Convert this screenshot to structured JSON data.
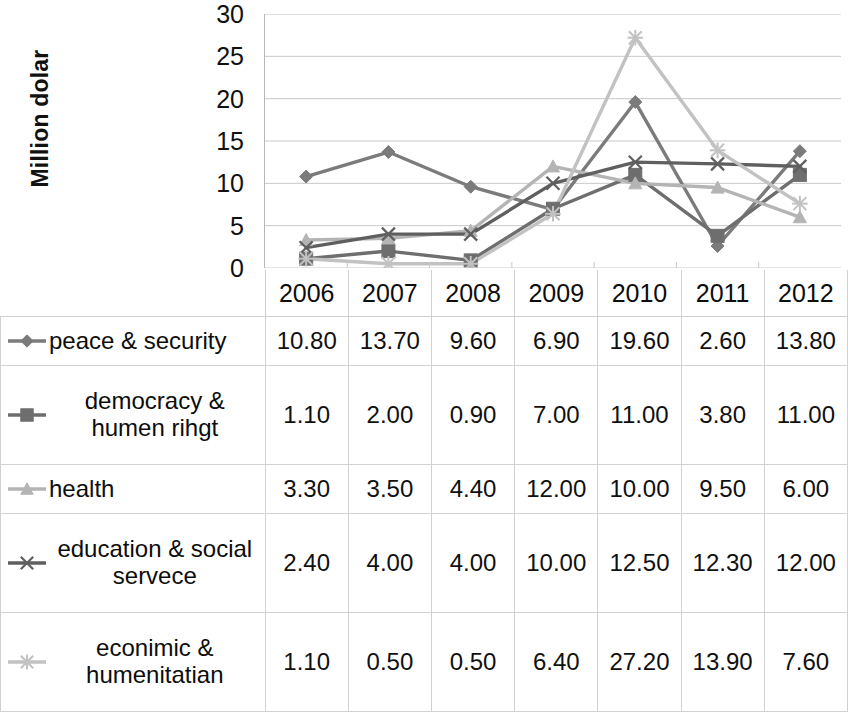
{
  "axis": {
    "y_title": "Million dolar",
    "y_ticks": [
      "30",
      "25",
      "20",
      "15",
      "10",
      "5",
      "0"
    ]
  },
  "table": {
    "year_header_blank": "",
    "years": [
      "2006",
      "2007",
      "2008",
      "2009",
      "2010",
      "2011",
      "2012"
    ],
    "rows": [
      {
        "label": "peace & security",
        "marker": "diamond-marker-icon",
        "color": "#7b7b7b",
        "values": [
          "10.80",
          "13.70",
          "9.60",
          "6.90",
          "19.60",
          "2.60",
          "13.80"
        ]
      },
      {
        "label": "democracy & humen rihgt",
        "marker": "square-marker-icon",
        "color": "#6e6e6e",
        "values": [
          "1.10",
          "2.00",
          "0.90",
          "7.00",
          "11.00",
          "3.80",
          "11.00"
        ]
      },
      {
        "label": "health",
        "marker": "triangle-marker-icon",
        "color": "#b4b4b4",
        "values": [
          "3.30",
          "3.50",
          "4.40",
          "12.00",
          "10.00",
          "9.50",
          "6.00"
        ]
      },
      {
        "label": "education & social servece",
        "marker": "cross-marker-icon",
        "color": "#5f5f5f",
        "values": [
          "2.40",
          "4.00",
          "4.00",
          "10.00",
          "12.50",
          "12.30",
          "12.00"
        ]
      },
      {
        "label": "econimic & humenitatian",
        "marker": "star-marker-icon",
        "color": "#c2c2c2",
        "values": [
          "1.10",
          "0.50",
          "0.50",
          "6.40",
          "27.20",
          "13.90",
          "7.60"
        ]
      }
    ]
  },
  "chart_data": {
    "type": "line",
    "title": "",
    "xlabel": "",
    "ylabel": "Million dolar",
    "categories": [
      "2006",
      "2007",
      "2008",
      "2009",
      "2010",
      "2011",
      "2012"
    ],
    "ylim": [
      0,
      30
    ],
    "yticks": [
      0,
      5,
      10,
      15,
      20,
      25,
      30
    ],
    "grid": true,
    "legend_position": "data-table-below",
    "series": [
      {
        "name": "peace & security",
        "marker": "diamond",
        "color": "#7b7b7b",
        "values": [
          10.8,
          13.7,
          9.6,
          6.9,
          19.6,
          2.6,
          13.8
        ]
      },
      {
        "name": "democracy & humen rihgt",
        "marker": "square",
        "color": "#6e6e6e",
        "values": [
          1.1,
          2.0,
          0.9,
          7.0,
          11.0,
          3.8,
          11.0
        ]
      },
      {
        "name": "health",
        "marker": "triangle",
        "color": "#b4b4b4",
        "values": [
          3.3,
          3.5,
          4.4,
          12.0,
          10.0,
          9.5,
          6.0
        ]
      },
      {
        "name": "education & social servece",
        "marker": "cross",
        "color": "#5f5f5f",
        "values": [
          2.4,
          4.0,
          4.0,
          10.0,
          12.5,
          12.3,
          12.0
        ]
      },
      {
        "name": "econimic & humenitatian",
        "marker": "star",
        "color": "#c2c2c2",
        "values": [
          1.1,
          0.5,
          0.5,
          6.4,
          27.2,
          13.9,
          7.6
        ]
      }
    ]
  }
}
